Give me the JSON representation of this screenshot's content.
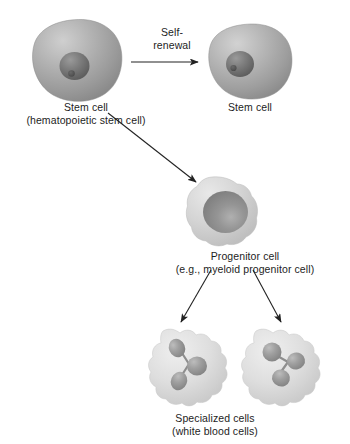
{
  "figure": {
    "background_color": "#ffffff",
    "line_color": "#222222"
  },
  "labels": {
    "self_renewal": {
      "line1": "Self-",
      "line2": "renewal"
    },
    "stem_cell_left": {
      "line1": "Stem cell",
      "line2": "(hematopoietic stem cell)"
    },
    "stem_cell_right": {
      "line1": "Stem cell"
    },
    "progenitor": {
      "line1": "Progenitor cell",
      "line2": "(e.g., myeloid progenitor cell)"
    },
    "specialized": {
      "line1": "Specialized cells",
      "line2": "(white blood cells)"
    }
  },
  "cells": {
    "stem_cell_left": {
      "name": "stem-cell-left",
      "cytoplasm_color": "#9e9e9e",
      "nucleus_color": "#6e6e6e"
    },
    "stem_cell_right": {
      "name": "stem-cell-right",
      "cytoplasm_color": "#a2a2a2",
      "nucleus_color": "#717171"
    },
    "progenitor_cell": {
      "name": "progenitor-cell",
      "cytoplasm_color": "#cfcfcf",
      "nucleus_color": "#8a8a8a"
    },
    "specialized_cell_left": {
      "name": "specialized-cell-left",
      "cytoplasm_color": "#dedede",
      "nucleus_color": "#989898"
    },
    "specialized_cell_right": {
      "name": "specialized-cell-right",
      "cytoplasm_color": "#dedede",
      "nucleus_color": "#989898"
    }
  },
  "arrows": {
    "self_renewal_arrow": "horizontal arrow from left stem cell to right stem cell",
    "differentiation_arrow": "diagonal arrow from left stem cell to progenitor cell",
    "specialize_arrow_left": "diagonal arrow from progenitor cell to left specialized cell",
    "specialize_arrow_right": "diagonal arrow from progenitor cell to right specialized cell"
  }
}
